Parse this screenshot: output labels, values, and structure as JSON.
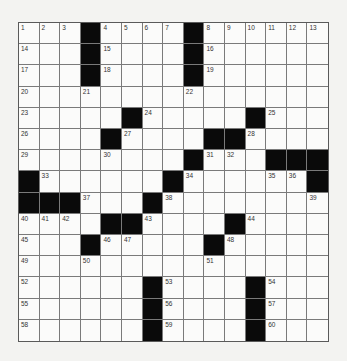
{
  "puzzle": {
    "rows": 15,
    "cols": 15,
    "grid": [
      "1 2 3 # 4 5 6 7 # 8 9 10 11 12 13",
      "14 . . # 15 . . . # 16 . . . . .",
      "17 . . # 18 . . . # 19 . . . . .",
      "20 . . 21 . . . . 22 . . . . . .",
      "23 . . . . # 24 . . . . # 25 . .",
      "26 . . . # 27 . . . # # 28 . . .",
      "29 . . . 30 . . . # 31 32 . # # #",
      "# 33 . . . . . # 34 . . . 35 36 #",
      "# # # 37 . . # 38 . . . . . . 39",
      "40 41 42 . # # 43 . . . # 44 . . .",
      "45 . . # 46 47 . . . # 48 . . . .",
      "49 . . 50 . . . . . 51 . . . . .",
      "52 . . . . . # 53 . . . # 54 . .",
      "55 . . . . . # 56 . . . # 57 . .",
      "58 . . . . . # 59 . . . # 60 . ."
    ],
    "legend": {
      "#": "black-square",
      ".": "empty-white-square",
      "number": "clue-number-in-white-square"
    }
  },
  "colors": {
    "background": "#f3f3f1",
    "cell": "#fbfbfa",
    "block": "#0a0a0a",
    "gridline": "#7a7a7a",
    "number": "#333333"
  }
}
